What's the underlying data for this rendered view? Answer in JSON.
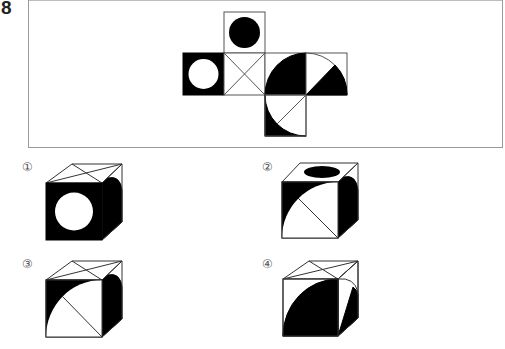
{
  "question": {
    "number": "8",
    "net": {
      "faces": [
        {
          "id": "top",
          "description": "black filled circle on white"
        },
        {
          "id": "left",
          "description": "white circle on black"
        },
        {
          "id": "center",
          "description": "X (both diagonals)"
        },
        {
          "id": "right1",
          "description": "black quarter disk centered at bottom-right corner"
        },
        {
          "id": "right2",
          "description": "quarter arc centered at bottom-left, 45° radius line, lower sector black"
        },
        {
          "id": "bottom",
          "description": "quarter arc centered at top-right, radius line, outside-arc corner black"
        }
      ]
    },
    "options": [
      {
        "label": "①",
        "top": "X diagonals",
        "front": "white circle on black",
        "right": "black with rounded corner"
      },
      {
        "label": "②",
        "top": "black ellipse",
        "front": "quarter arc, top-left black, radius line",
        "right": "black with rounded corner"
      },
      {
        "label": "③",
        "top": "X diagonals",
        "front": "quarter arc, top-left black, radius line",
        "right": "black with rounded corner"
      },
      {
        "label": "④",
        "top": "X diagonals",
        "front": "black quarter disk",
        "right": "arc with black sector"
      }
    ]
  },
  "colors": {
    "ink": "#000000",
    "frame": "#9a9a9a",
    "label": "#555555"
  }
}
